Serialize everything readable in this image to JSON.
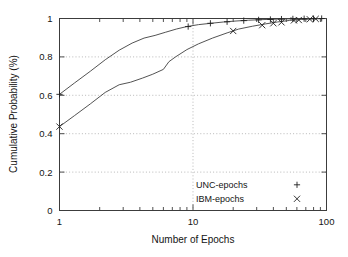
{
  "chart_data": {
    "type": "line",
    "title": "",
    "xlabel": "Number of Epochs",
    "ylabel": "Cumulative Probability (%)",
    "xscale": "log",
    "yscale": "linear",
    "xlim": [
      1,
      100
    ],
    "ylim": [
      0,
      1
    ],
    "xticks": [
      1,
      10,
      100
    ],
    "xtick_labels": [
      "1",
      "10",
      "100"
    ],
    "yticks": [
      0,
      0.2,
      0.4,
      0.6,
      0.8,
      1
    ],
    "ytick_labels": [
      "0",
      "0.2",
      "0.4",
      "0.6",
      "0.8",
      "1"
    ],
    "grid": "dotted-both-axes",
    "legend_position": "inside lower-right",
    "series": [
      {
        "name": "UNC-epochs",
        "marker": "+",
        "color": "#4a4a4a",
        "x": [
          1,
          1.3,
          1.7,
          2.2,
          2.8,
          3.5,
          4.3,
          5.2,
          6.2,
          7.5,
          9,
          11,
          14,
          17,
          21,
          26,
          32,
          40,
          50,
          62,
          76,
          88,
          100
        ],
        "y": [
          0.605,
          0.665,
          0.725,
          0.785,
          0.835,
          0.872,
          0.898,
          0.912,
          0.928,
          0.945,
          0.958,
          0.968,
          0.976,
          0.982,
          0.987,
          0.991,
          0.994,
          0.996,
          0.998,
          0.999,
          0.999,
          1.0,
          1.0
        ]
      },
      {
        "name": "IBM-epochs",
        "marker": "x",
        "color": "#4a4a4a",
        "x": [
          1,
          1.3,
          1.7,
          2.2,
          2.8,
          3.4,
          4.2,
          5.0,
          6.0,
          6.6,
          7.4,
          9,
          11,
          14,
          18,
          22,
          28,
          35,
          43,
          53,
          65,
          80,
          100
        ],
        "y": [
          0.437,
          0.495,
          0.555,
          0.615,
          0.655,
          0.668,
          0.69,
          0.71,
          0.735,
          0.775,
          0.8,
          0.838,
          0.868,
          0.898,
          0.925,
          0.945,
          0.96,
          0.972,
          0.982,
          0.99,
          0.995,
          0.998,
          1.0
        ]
      }
    ],
    "marker_points": {
      "UNC-epochs": [
        {
          "x": 1,
          "y": 0.605
        },
        {
          "x": 9.2,
          "y": 0.958
        },
        {
          "x": 13.5,
          "y": 0.975
        },
        {
          "x": 18,
          "y": 0.983
        },
        {
          "x": 24,
          "y": 0.989
        },
        {
          "x": 31,
          "y": 0.993
        },
        {
          "x": 38,
          "y": 0.995
        },
        {
          "x": 46,
          "y": 0.997
        },
        {
          "x": 56,
          "y": 0.998
        },
        {
          "x": 68,
          "y": 0.999
        },
        {
          "x": 80,
          "y": 1.0
        },
        {
          "x": 92,
          "y": 1.0
        }
      ],
      "IBM-epochs": [
        {
          "x": 1,
          "y": 0.437
        },
        {
          "x": 20,
          "y": 0.935
        },
        {
          "x": 33,
          "y": 0.965
        },
        {
          "x": 40,
          "y": 0.975
        },
        {
          "x": 46,
          "y": 0.98
        },
        {
          "x": 57,
          "y": 0.99
        },
        {
          "x": 62,
          "y": 0.992
        },
        {
          "x": 75,
          "y": 0.996
        },
        {
          "x": 83,
          "y": 0.998
        }
      ]
    }
  },
  "legend": {
    "entries": [
      {
        "label": "UNC-epochs",
        "glyph": "+"
      },
      {
        "label": "IBM-epochs",
        "glyph": "×"
      }
    ]
  },
  "axes": {
    "x_title": "Number of Epochs",
    "y_title": "Cumulative Probability (%)"
  }
}
